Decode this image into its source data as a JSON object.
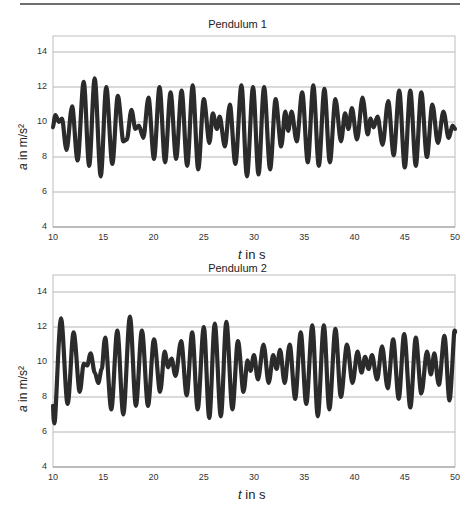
{
  "page": {
    "top_rule": true
  },
  "chart_data": [
    {
      "type": "line",
      "title": "Pendulum 1",
      "xlabel_var": "t",
      "xlabel_unit": " in s",
      "ylabel_var": "a",
      "ylabel_unit": " in m/s²",
      "xlim": [
        10,
        50
      ],
      "ylim": [
        4,
        15
      ],
      "xticks": [
        10,
        15,
        20,
        25,
        30,
        35,
        40,
        45,
        50
      ],
      "yticks": [
        4,
        6,
        8,
        10,
        12,
        14
      ],
      "grid": "horizontal",
      "line_color": "#2b2b2b",
      "series": [
        {
          "name": "Pendulum 1",
          "points": [
            [
              10.0,
              9.7
            ],
            [
              10.25,
              10.4
            ],
            [
              10.6,
              10.0
            ],
            [
              10.9,
              10.2
            ],
            [
              11.35,
              8.4
            ],
            [
              11.9,
              10.9
            ],
            [
              12.45,
              7.8
            ],
            [
              13.05,
              12.3
            ],
            [
              13.6,
              7.5
            ],
            [
              14.15,
              12.5
            ],
            [
              14.75,
              6.9
            ],
            [
              15.3,
              12.0
            ],
            [
              15.9,
              7.6
            ],
            [
              16.45,
              11.5
            ],
            [
              17.0,
              8.9
            ],
            [
              17.35,
              9.0
            ],
            [
              17.8,
              10.7
            ],
            [
              18.2,
              9.6
            ],
            [
              18.55,
              9.8
            ],
            [
              19.0,
              9.1
            ],
            [
              19.5,
              11.4
            ],
            [
              20.05,
              7.9
            ],
            [
              20.6,
              12.0
            ],
            [
              21.15,
              7.7
            ],
            [
              21.7,
              11.7
            ],
            [
              22.25,
              7.9
            ],
            [
              22.8,
              11.8
            ],
            [
              23.35,
              7.5
            ],
            [
              23.9,
              12.1
            ],
            [
              24.45,
              7.3
            ],
            [
              25.0,
              11.3
            ],
            [
              25.55,
              8.8
            ],
            [
              25.9,
              10.5
            ],
            [
              26.3,
              9.6
            ],
            [
              26.6,
              10.3
            ],
            [
              27.1,
              8.6
            ],
            [
              27.6,
              11.0
            ],
            [
              28.15,
              7.6
            ],
            [
              28.75,
              12.1
            ],
            [
              29.3,
              6.9
            ],
            [
              29.9,
              12.0
            ],
            [
              30.45,
              7.0
            ],
            [
              31.0,
              12.0
            ],
            [
              31.6,
              7.3
            ],
            [
              32.15,
              11.3
            ],
            [
              32.7,
              8.6
            ],
            [
              33.1,
              10.6
            ],
            [
              33.4,
              9.5
            ],
            [
              33.75,
              10.6
            ],
            [
              34.25,
              8.9
            ],
            [
              34.8,
              11.7
            ],
            [
              35.35,
              7.7
            ],
            [
              35.9,
              12.1
            ],
            [
              36.45,
              7.5
            ],
            [
              37.0,
              11.9
            ],
            [
              37.55,
              7.7
            ],
            [
              38.1,
              11.3
            ],
            [
              38.65,
              8.9
            ],
            [
              39.05,
              10.5
            ],
            [
              39.4,
              9.6
            ],
            [
              39.75,
              10.8
            ],
            [
              40.25,
              9.0
            ],
            [
              40.8,
              11.4
            ],
            [
              41.3,
              9.3
            ],
            [
              41.6,
              10.2
            ],
            [
              41.9,
              9.7
            ],
            [
              42.3,
              10.3
            ],
            [
              42.8,
              8.7
            ],
            [
              43.35,
              11.2
            ],
            [
              43.9,
              8.1
            ],
            [
              44.45,
              11.8
            ],
            [
              45.0,
              7.4
            ],
            [
              45.55,
              11.8
            ],
            [
              46.1,
              7.5
            ],
            [
              46.65,
              11.7
            ],
            [
              47.2,
              8.0
            ],
            [
              47.75,
              11.0
            ],
            [
              48.3,
              8.8
            ],
            [
              48.85,
              10.6
            ],
            [
              49.35,
              9.1
            ],
            [
              49.75,
              9.8
            ],
            [
              50.0,
              9.6
            ]
          ]
        }
      ]
    },
    {
      "type": "line",
      "title": "Pendulum 2",
      "xlabel_var": "t",
      "xlabel_unit": " in s",
      "ylabel_var": "a",
      "ylabel_unit": " in m/s²",
      "xlim": [
        10,
        50
      ],
      "ylim": [
        4,
        15
      ],
      "xticks": [
        10,
        15,
        20,
        25,
        30,
        35,
        40,
        45,
        50
      ],
      "yticks": [
        4,
        6,
        8,
        10,
        12,
        14
      ],
      "grid": "horizontal",
      "line_color": "#2b2b2b",
      "series": [
        {
          "name": "Pendulum 2",
          "points": [
            [
              10.0,
              7.5
            ],
            [
              10.15,
              6.5
            ],
            [
              10.8,
              12.5
            ],
            [
              11.45,
              7.6
            ],
            [
              12.05,
              11.7
            ],
            [
              12.65,
              8.3
            ],
            [
              13.05,
              9.9
            ],
            [
              13.4,
              9.8
            ],
            [
              13.75,
              10.5
            ],
            [
              14.15,
              9.4
            ],
            [
              14.5,
              8.8
            ],
            [
              14.85,
              9.6
            ],
            [
              15.2,
              11.4
            ],
            [
              15.8,
              7.3
            ],
            [
              16.4,
              11.8
            ],
            [
              17.0,
              7.0
            ],
            [
              17.65,
              12.6
            ],
            [
              18.25,
              7.5
            ],
            [
              18.85,
              11.8
            ],
            [
              19.45,
              7.5
            ],
            [
              20.05,
              11.3
            ],
            [
              20.65,
              8.3
            ],
            [
              21.1,
              10.6
            ],
            [
              21.45,
              9.7
            ],
            [
              21.8,
              10.2
            ],
            [
              22.2,
              9.2
            ],
            [
              22.75,
              11.2
            ],
            [
              23.3,
              8.1
            ],
            [
              23.85,
              11.7
            ],
            [
              24.4,
              7.3
            ],
            [
              25.0,
              12.0
            ],
            [
              25.55,
              6.8
            ],
            [
              26.1,
              12.2
            ],
            [
              26.7,
              6.9
            ],
            [
              27.25,
              12.3
            ],
            [
              27.85,
              7.3
            ],
            [
              28.4,
              11.2
            ],
            [
              28.95,
              8.3
            ],
            [
              29.35,
              10.1
            ],
            [
              29.65,
              9.5
            ],
            [
              30.0,
              10.4
            ],
            [
              30.4,
              9.0
            ],
            [
              30.95,
              11.0
            ],
            [
              31.45,
              8.8
            ],
            [
              31.9,
              10.4
            ],
            [
              32.25,
              9.6
            ],
            [
              32.6,
              10.7
            ],
            [
              33.05,
              8.8
            ],
            [
              33.55,
              11.0
            ],
            [
              34.1,
              7.9
            ],
            [
              34.65,
              11.7
            ],
            [
              35.2,
              7.6
            ],
            [
              35.8,
              12.1
            ],
            [
              36.35,
              6.9
            ],
            [
              36.95,
              12.1
            ],
            [
              37.5,
              7.3
            ],
            [
              38.1,
              11.9
            ],
            [
              38.65,
              8.0
            ],
            [
              39.25,
              11.0
            ],
            [
              39.8,
              8.8
            ],
            [
              40.3,
              10.6
            ],
            [
              40.7,
              9.4
            ],
            [
              41.05,
              10.3
            ],
            [
              41.4,
              9.6
            ],
            [
              41.75,
              10.4
            ],
            [
              42.25,
              9.0
            ],
            [
              42.75,
              10.9
            ],
            [
              43.3,
              8.5
            ],
            [
              43.85,
              11.3
            ],
            [
              44.4,
              7.9
            ],
            [
              44.95,
              11.6
            ],
            [
              45.55,
              7.4
            ],
            [
              46.1,
              11.4
            ],
            [
              46.65,
              8.2
            ],
            [
              47.2,
              10.6
            ],
            [
              47.6,
              9.3
            ],
            [
              47.95,
              10.5
            ],
            [
              48.4,
              8.7
            ],
            [
              48.95,
              11.5
            ],
            [
              49.45,
              7.8
            ],
            [
              49.95,
              11.8
            ],
            [
              50.0,
              11.7
            ]
          ]
        }
      ]
    }
  ]
}
